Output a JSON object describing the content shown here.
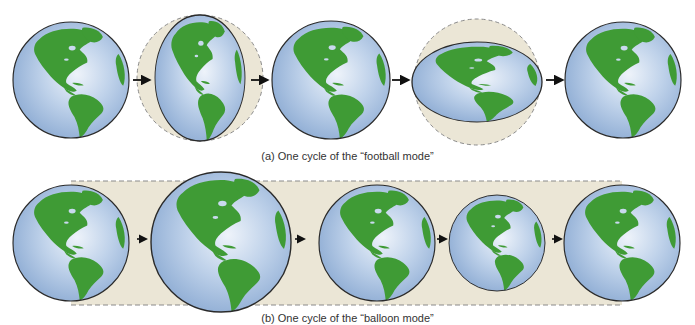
{
  "figure": {
    "top_cutoff_text": "",
    "panels": [
      {
        "id": "a",
        "caption": "(a) One cycle of the “football mode”",
        "mode": "football",
        "stages": [
          {
            "shape": "sphere",
            "cx": 71,
            "cy": 80,
            "rx": 58,
            "ry": 58
          },
          {
            "shape": "prolate-vertical",
            "cx": 200,
            "cy": 78,
            "rx": 45,
            "ry": 63,
            "ghost_r": 63
          },
          {
            "shape": "sphere",
            "cx": 331,
            "cy": 80,
            "rx": 59,
            "ry": 59
          },
          {
            "shape": "oblate-horizontal",
            "cx": 477,
            "cy": 82,
            "rx": 65,
            "ry": 40,
            "ghost_r": 63
          },
          {
            "shape": "sphere",
            "cx": 623,
            "cy": 80,
            "rx": 58,
            "ry": 58
          }
        ],
        "arrows": [
          {
            "x1": 133,
            "x2": 150,
            "y": 80
          },
          {
            "x1": 251,
            "x2": 268,
            "y": 80
          },
          {
            "x1": 392,
            "x2": 409,
            "y": 80
          },
          {
            "x1": 546,
            "x2": 563,
            "y": 80
          }
        ]
      },
      {
        "id": "b",
        "caption": "(b) One cycle of the “balloon mode”",
        "mode": "balloon",
        "band": {
          "x1": 71,
          "x2": 622,
          "y1": 181,
          "y2": 305
        },
        "stages": [
          {
            "shape": "sphere",
            "cx": 71,
            "cy": 243,
            "rx": 58,
            "ry": 58
          },
          {
            "shape": "expanded",
            "cx": 221,
            "cy": 242,
            "rx": 70,
            "ry": 70
          },
          {
            "shape": "sphere",
            "cx": 377,
            "cy": 243,
            "rx": 58,
            "ry": 58
          },
          {
            "shape": "contracted",
            "cx": 497,
            "cy": 243,
            "rx": 48,
            "ry": 48
          },
          {
            "shape": "sphere",
            "cx": 622,
            "cy": 243,
            "rx": 58,
            "ry": 58
          }
        ],
        "arrows": [
          {
            "x1": 137,
            "x2": 147,
            "y": 239
          },
          {
            "x1": 295,
            "x2": 305,
            "y": 239
          },
          {
            "x1": 437,
            "x2": 447,
            "y": 239
          },
          {
            "x1": 552,
            "x2": 562,
            "y": 239
          }
        ]
      }
    ],
    "colors": {
      "ocean_light": "#dde8f4",
      "ocean_mid": "#a9c2e2",
      "ocean_dark": "#7e9ecb",
      "land": "#3f9b35",
      "outline": "#2a2a2a",
      "ghost_fill": "#ebe6d6",
      "ghost_stroke": "#8a8a8a",
      "arrow": "#111111",
      "caption": "#333333"
    }
  }
}
